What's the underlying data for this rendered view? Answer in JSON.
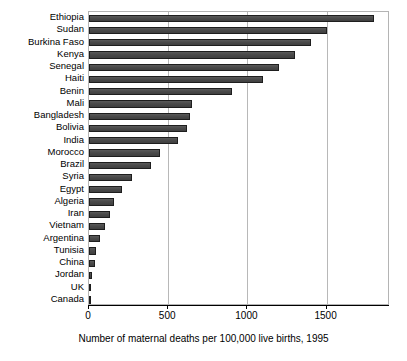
{
  "chart_data": {
    "type": "bar",
    "orientation": "horizontal",
    "title": "",
    "subtitle": "",
    "xlabel": "Number of maternal deaths per 100,000 live births, 1995",
    "ylabel": "",
    "xlim": [
      0,
      1900
    ],
    "xticks": [
      0,
      500,
      1000,
      1500
    ],
    "xtick_labels": [
      "0",
      "500",
      "1000",
      "1500"
    ],
    "grid": "vertical",
    "legend": "none",
    "bar_color": "#4d4d4d",
    "bar_edge_color": "#1e1e1e",
    "categories": [
      "Ethiopia",
      "Sudan",
      "Burkina Faso",
      "Kenya",
      "Senegal",
      "Haiti",
      "Benin",
      "Mali",
      "Bangladesh",
      "Bolivia",
      "India",
      "Morocco",
      "Brazil",
      "Syria",
      "Egypt",
      "Algeria",
      "Iran",
      "Vietnam",
      "Argentina",
      "Tunisia",
      "China",
      "Jordan",
      "UK",
      "Canada"
    ],
    "values": [
      1800,
      1500,
      1400,
      1300,
      1200,
      1100,
      900,
      650,
      640,
      620,
      560,
      450,
      390,
      270,
      210,
      160,
      130,
      100,
      70,
      45,
      35,
      20,
      12,
      10
    ]
  },
  "axis": {
    "x_title": "Number of maternal deaths per 100,000 live births, 1995"
  }
}
